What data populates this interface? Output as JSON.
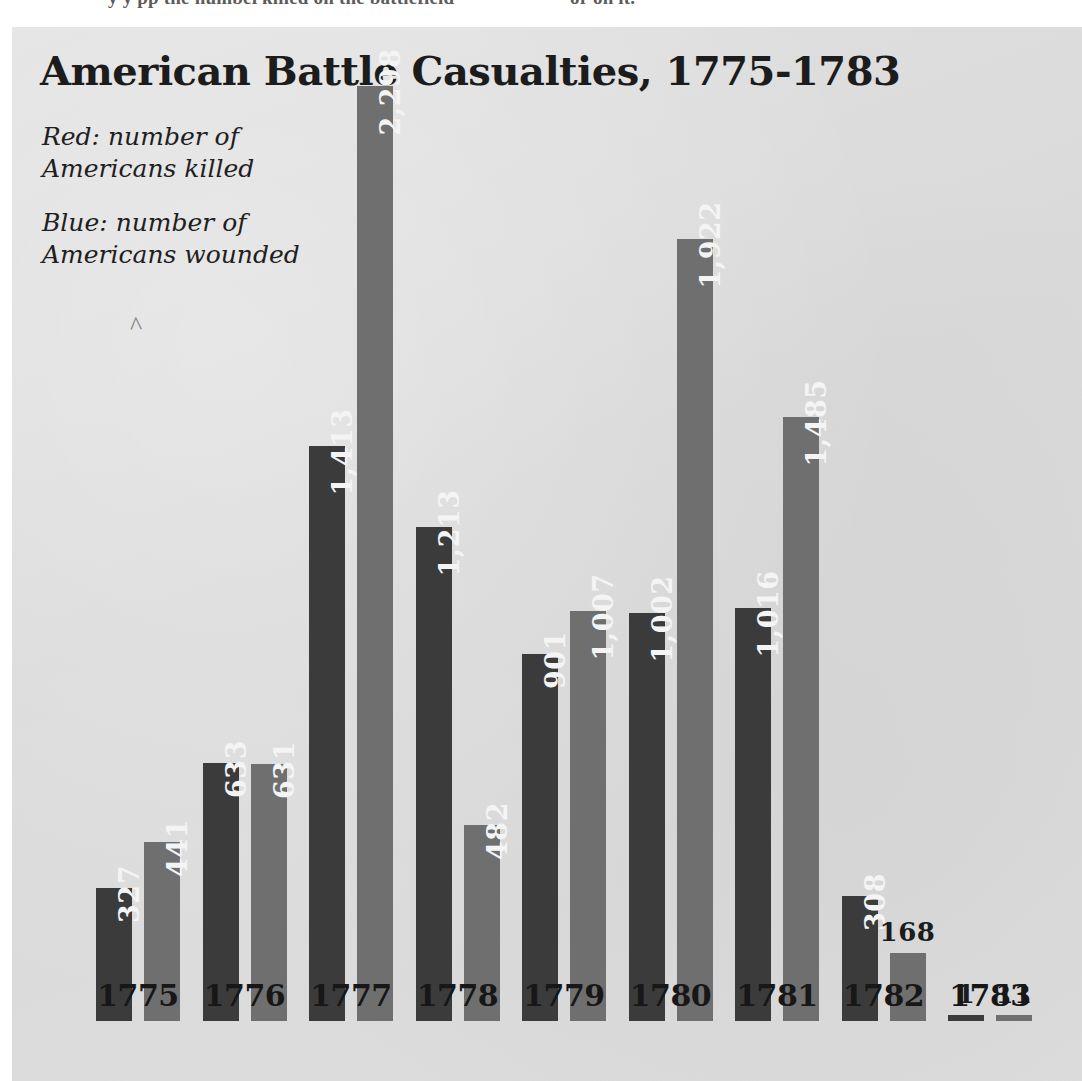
{
  "page_top_text": {
    "segment_1": "y   y    pp    the number",
    "segment_2": "killed on the battlefield",
    "segment_3": "or on it.",
    "segment_4": ""
  },
  "chart": {
    "title": "American Battle Casualties, 1775-1783",
    "legend": {
      "red_line_1": "Red: number of",
      "red_line_2": "Americans killed",
      "blue_line_1": "Blue: number of",
      "blue_line_2": "Americans wounded"
    },
    "artifact_mark": "^",
    "colors": {
      "killed_bar": "#3b3b3b",
      "wounded_bar": "#6f6f6f",
      "panel_background": "#dcdcdc",
      "value_label_text": "#f4f4f4",
      "title_text": "#1c1c1c"
    }
  },
  "chart_data": {
    "type": "bar",
    "title": "American Battle Casualties, 1775-1783",
    "xlabel": "",
    "ylabel": "",
    "ylim": [
      0,
      2298
    ],
    "grid": false,
    "legend_position": "top-left",
    "categories": [
      "1775",
      "1776",
      "1777",
      "1778",
      "1779",
      "1780",
      "1781",
      "1782",
      "1783"
    ],
    "series": [
      {
        "name": "Red: number of Americans killed",
        "color": "#3b3b3b",
        "values": [
          327,
          633,
          1413,
          1213,
          901,
          1002,
          1016,
          308,
          1
        ],
        "labels": [
          "327",
          "633",
          "1,413",
          "1,213",
          "901",
          "1,002",
          "1,016",
          "308",
          "1"
        ]
      },
      {
        "name": "Blue: number of Americans wounded",
        "color": "#6f6f6f",
        "values": [
          441,
          631,
          2298,
          482,
          1007,
          1922,
          1485,
          168,
          11
        ],
        "labels": [
          "441",
          "631",
          "2,298",
          "482",
          "1,007",
          "1,922",
          "1,485",
          "168",
          "11"
        ]
      }
    ]
  }
}
